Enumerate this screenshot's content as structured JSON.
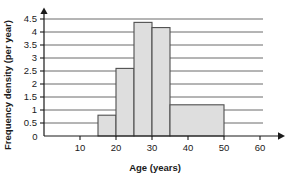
{
  "chart_data": {
    "type": "bar",
    "title": "",
    "subtitle": "",
    "xlabel": "Age (years)",
    "ylabel": "Frequency density (per year)",
    "xlim": [
      0,
      60
    ],
    "ylim": [
      0,
      4.5
    ],
    "grid": true,
    "legend": false,
    "legend_position": "none",
    "xticks": [
      0,
      10,
      20,
      30,
      40,
      50,
      60
    ],
    "xtick_labels": [
      "0",
      "10",
      "20",
      "30",
      "40",
      "50",
      "60"
    ],
    "yticks": [
      0,
      0.5,
      1,
      1.5,
      2,
      2.5,
      3,
      3.5,
      4,
      4.5
    ],
    "ytick_labels": [
      "0",
      "0.5",
      "1",
      "1.5",
      "2",
      "2.5",
      "3",
      "3.5",
      "4",
      "4.5"
    ],
    "bin_edges": [
      15,
      20,
      25,
      30,
      35,
      50
    ],
    "categories": [
      "15-20",
      "20-25",
      "25-30",
      "30-35",
      "35-50"
    ],
    "values": [
      0.8,
      2.6,
      4.37,
      4.17,
      1.2
    ],
    "bars": [
      {
        "label": "15-20",
        "x_start": 15,
        "x_end": 20,
        "value": 0.8
      },
      {
        "label": "20-25",
        "x_start": 20,
        "x_end": 25,
        "value": 2.6
      },
      {
        "label": "25-30",
        "x_start": 25,
        "x_end": 30,
        "value": 4.37
      },
      {
        "label": "30-35",
        "x_start": 30,
        "x_end": 35,
        "value": 4.17
      },
      {
        "label": "35-50",
        "x_start": 35,
        "x_end": 50,
        "value": 1.2
      }
    ],
    "colors": {
      "bar_fill": "#dedede",
      "bar_stroke": "#4f4f4f",
      "gridline": "#5a5a5a",
      "axis": "#1a1a1a",
      "text": "#1a1a1a",
      "background": "#ffffff"
    }
  }
}
